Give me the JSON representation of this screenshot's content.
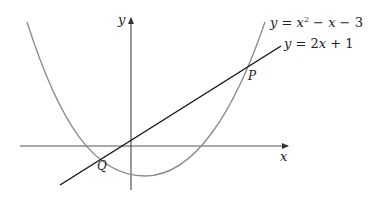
{
  "diagram": {
    "axes": {
      "x_label": "x",
      "y_label": "y",
      "x_axis_color": "#555555",
      "y_axis_color": "#444444"
    },
    "curves": [
      {
        "id": "parabola",
        "type": "curve",
        "equation_prefix": "y = ",
        "equation_var1": "x",
        "equation_exp": "2",
        "equation_rest1": " − ",
        "equation_var2": "x",
        "equation_rest2": " − 3",
        "equation_text": "y = x² − x − 3",
        "color": "#8a8a8a"
      },
      {
        "id": "line",
        "type": "line",
        "equation_prefix": "y = 2",
        "equation_var1": "x",
        "equation_rest1": " + 1",
        "equation_text": "y = 2x + 1",
        "color": "#111111"
      }
    ],
    "points": [
      {
        "label": "P",
        "description": "upper intersection of line and parabola"
      },
      {
        "label": "Q",
        "description": "lower intersection of line and parabola"
      }
    ]
  }
}
